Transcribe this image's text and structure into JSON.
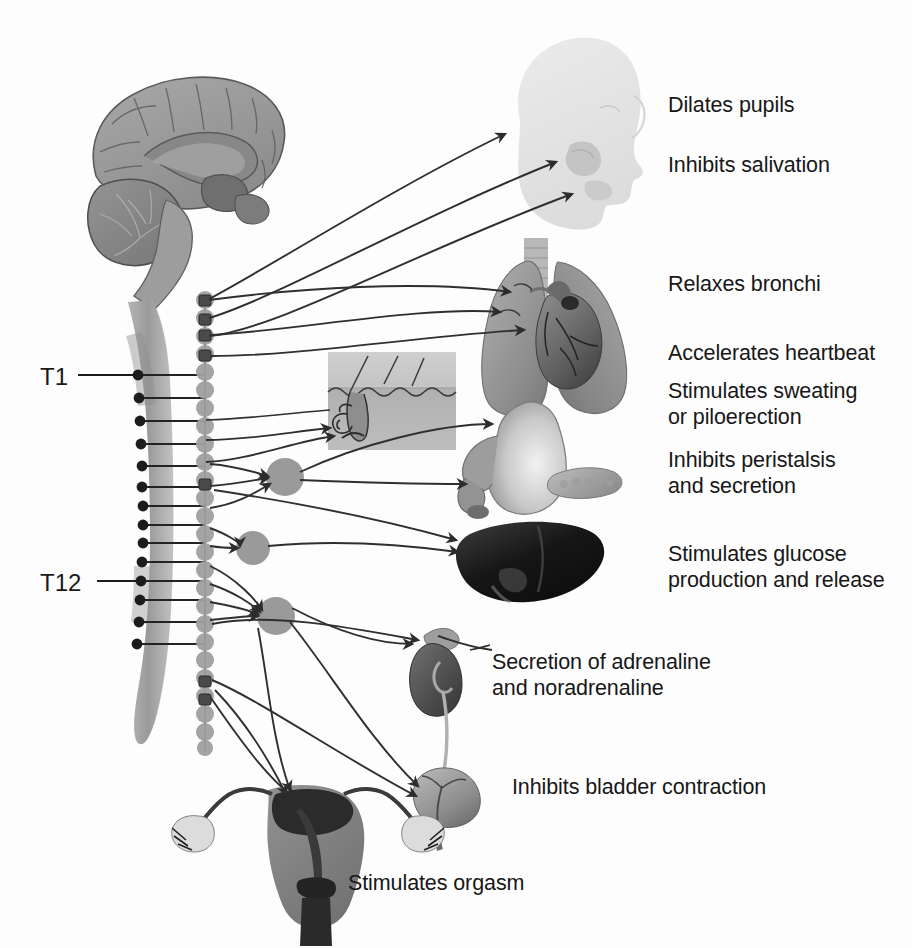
{
  "figure": {
    "background_color": "#fdfdfd",
    "text_color": "#171717",
    "accent_gray": "#8f8f8f"
  },
  "spinal_labels": [
    {
      "id": "t1",
      "text": "T1",
      "x": 40,
      "y": 365
    },
    {
      "id": "t12",
      "text": "T12",
      "x": 40,
      "y": 573
    }
  ],
  "effect_labels": [
    {
      "id": "dilates-pupils",
      "lines": [
        "Dilates pupils"
      ],
      "x": 668,
      "y": 92
    },
    {
      "id": "inhibits-salivation",
      "lines": [
        "Inhibits salivation"
      ],
      "x": 668,
      "y": 152
    },
    {
      "id": "relaxes-bronchi",
      "lines": [
        "Relaxes bronchi"
      ],
      "x": 668,
      "y": 272
    },
    {
      "id": "accelerates-heartbeat",
      "lines": [
        "Accelerates heartbeat"
      ],
      "x": 668,
      "y": 341
    },
    {
      "id": "stimulates-sweating",
      "lines": [
        "Stimulates sweating",
        "or piloerection"
      ],
      "x": 668,
      "y": 378
    },
    {
      "id": "inhibits-peristalsis",
      "lines": [
        "Inhibits peristalsis",
        "and secretion"
      ],
      "x": 668,
      "y": 448
    },
    {
      "id": "stimulates-glucose",
      "lines": [
        "Stimulates glucose",
        "production and release"
      ],
      "x": 668,
      "y": 542
    },
    {
      "id": "secretion-adrenaline",
      "lines": [
        "Secretion of adrenaline",
        "and noradrenaline"
      ],
      "x": 492,
      "y": 650
    },
    {
      "id": "inhibits-bladder",
      "lines": [
        "Inhibits bladder contraction"
      ],
      "x": 512,
      "y": 775
    },
    {
      "id": "stimulates-orgasm",
      "lines": [
        "Stimulates orgasm"
      ],
      "x": 348,
      "y": 871
    }
  ],
  "anatomy": [
    {
      "id": "brain",
      "name": "brain-sagittal-section",
      "region": "upper-left"
    },
    {
      "id": "spinal-cord",
      "name": "spinal-cord",
      "region": "left-column"
    },
    {
      "id": "sympathetic-chain",
      "name": "sympathetic-ganglion-chain",
      "region": "left-column"
    },
    {
      "id": "head",
      "name": "head-profile-silhouette",
      "region": "top-center"
    },
    {
      "id": "lungs-heart",
      "name": "lungs-and-heart",
      "region": "middle-right"
    },
    {
      "id": "skin-inset",
      "name": "skin-hair-follicle-sweat-gland-inset",
      "region": "middle-center"
    },
    {
      "id": "stomach",
      "name": "stomach-duodenum-pancreas",
      "region": "middle-right"
    },
    {
      "id": "liver",
      "name": "liver",
      "region": "lower-right"
    },
    {
      "id": "kidney-adrenal",
      "name": "kidney-with-adrenal-gland",
      "region": "lower-center"
    },
    {
      "id": "bladder",
      "name": "urinary-bladder",
      "region": "lower-center"
    },
    {
      "id": "uterus",
      "name": "uterus-with-ovaries",
      "region": "bottom-center"
    }
  ],
  "ganglia": {
    "chain_ganglion_count": 22,
    "prevertebral_ganglia": [
      {
        "id": "celiac",
        "cx": 285,
        "cy": 477,
        "r": 19
      },
      {
        "id": "superior-mesenteric",
        "cx": 253,
        "cy": 548,
        "r": 17
      },
      {
        "id": "inferior-mesenteric",
        "cx": 276,
        "cy": 616,
        "r": 19
      }
    ]
  }
}
